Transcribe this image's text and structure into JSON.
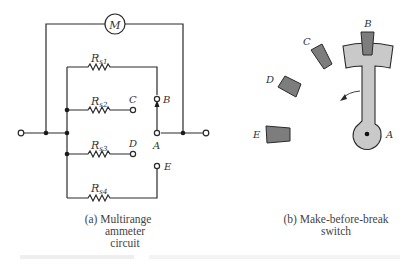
{
  "figure_a": {
    "meter_label": "M",
    "resistors": [
      {
        "name": "R",
        "sub": "s1"
      },
      {
        "name": "R",
        "sub": "s2"
      },
      {
        "name": "R",
        "sub": "s3"
      },
      {
        "name": "R",
        "sub": "s4"
      }
    ],
    "terminals": {
      "A": "A",
      "B": "B",
      "C": "C",
      "D": "D",
      "E": "E"
    },
    "caption": [
      "(a) Multirange",
      "ammeter",
      "circuit"
    ]
  },
  "figure_b": {
    "contacts": {
      "A": "A",
      "B": "B",
      "C": "C",
      "D": "D",
      "E": "E"
    },
    "caption": [
      "(b) Make-before-break",
      "switch"
    ]
  },
  "colors": {
    "wire": "#2a2a2a",
    "contact": "#7d7d7d",
    "arm": "#c9c9c9"
  }
}
